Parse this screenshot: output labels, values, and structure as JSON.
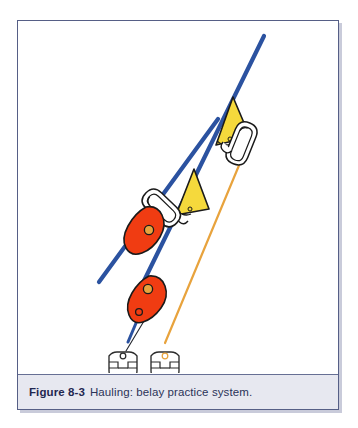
{
  "figure": {
    "label": "Figure 8-3",
    "caption": "Hauling: belay practice system.",
    "alt_title": "Hauling: belay practice system."
  },
  "colors": {
    "rope_blue": "#2B52A0",
    "rope_orange": "#E8A33D",
    "pulley_red": "#F03C12",
    "pulley_yellow": "#F5D93C",
    "hardware_outline": "#1a1a1a",
    "frame_border": "#565f86",
    "caption_background": "#E7E8F0",
    "caption_text": "#2B3358",
    "page_background": "#FFFFFF",
    "shadow": "#C9CBDA"
  },
  "diagram": {
    "type": "technical-illustration",
    "components": [
      {
        "name": "upper-yellow-pulley",
        "color": "#F5D93C",
        "shape": "triangular-pulley"
      },
      {
        "name": "upper-carabiner",
        "color": "#FFFFFF",
        "shape": "oval-carabiner"
      },
      {
        "name": "middle-yellow-pulley",
        "color": "#F5D93C",
        "shape": "triangular-pulley"
      },
      {
        "name": "middle-carabiner",
        "color": "#FFFFFF",
        "shape": "oval-carabiner"
      },
      {
        "name": "upper-red-pulley",
        "color": "#F03C12",
        "shape": "teardrop-pulley"
      },
      {
        "name": "lower-red-pulley",
        "color": "#F03C12",
        "shape": "teardrop-pulley"
      },
      {
        "name": "left-bolt-hanger",
        "color": "#FFFFFF",
        "shape": "anchor-plate"
      },
      {
        "name": "right-bolt-hanger",
        "color": "#FFFFFF",
        "shape": "anchor-plate"
      },
      {
        "name": "blue-haul-rope",
        "color": "#2B52A0",
        "shape": "line"
      },
      {
        "name": "orange-belay-line",
        "color": "#E8A33D",
        "shape": "line"
      }
    ]
  }
}
